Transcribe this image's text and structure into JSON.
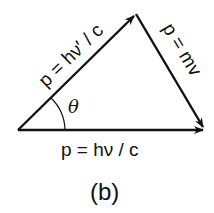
{
  "diagram": {
    "labels": {
      "incident_photon": "p = hν / c",
      "scattered_photon": "p = hν′ / c",
      "electron": "p = mv",
      "angle": "θ",
      "caption": "(b)"
    },
    "vectors": [
      {
        "name": "scattered-photon-momentum",
        "from": [
          18,
          130
        ],
        "to": [
          136,
          14
        ]
      },
      {
        "name": "electron-momentum",
        "from": [
          136,
          14
        ],
        "to": [
          204,
          128
        ]
      },
      {
        "name": "incident-photon-momentum",
        "from": [
          18,
          130
        ],
        "to": [
          204,
          130
        ]
      }
    ],
    "colors": {
      "stroke": "#111111",
      "background": "#ffffff"
    }
  }
}
